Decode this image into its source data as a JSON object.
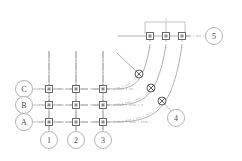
{
  "drawing": {
    "title": "Structural Grid Plan",
    "canvas": {
      "width": 242,
      "height": 161,
      "background": "#ffffff"
    },
    "colors": {
      "grid_line": "#9a9a9a",
      "center_line": "#a8a8a8",
      "node_stroke": "#5a5a5a",
      "node_fill": "#c8c8c8",
      "bubble_stroke": "#a0a0a0",
      "text": "#4a4a4a",
      "dimension": "#9a9a9a"
    },
    "row_grids": [
      {
        "label": "C",
        "bubble_cx": 24,
        "bubble_cy": 89,
        "y": 89,
        "x_start": 33,
        "x_end": 133
      },
      {
        "label": "B",
        "bubble_cx": 24,
        "bubble_cy": 105,
        "y": 105,
        "x_start": 33,
        "x_end": 143
      },
      {
        "label": "A",
        "bubble_cx": 24,
        "bubble_cy": 122,
        "y": 122,
        "x_start": 33,
        "x_end": 152
      }
    ],
    "column_grids": [
      {
        "label": "1",
        "bubble_cx": 49,
        "bubble_cy": 140,
        "x": 49,
        "y_start": 51,
        "y_end": 131
      },
      {
        "label": "2",
        "bubble_cx": 76,
        "bubble_cy": 140,
        "x": 76,
        "y_start": 51,
        "y_end": 131
      },
      {
        "label": "3",
        "bubble_cx": 103,
        "bubble_cy": 140,
        "x": 103,
        "y_start": 51,
        "y_end": 131
      }
    ],
    "radial_grids": [
      {
        "label": "5",
        "bubble_cx": 214,
        "bubble_cy": 36,
        "y": 36,
        "x_start": 118,
        "x_end": 205
      },
      {
        "label": "4",
        "bubble_cx": 176,
        "bubble_cy": 118,
        "x": 176,
        "y": 118
      }
    ],
    "square_nodes": [
      {
        "name": "node-C1",
        "x": 49,
        "y": 89
      },
      {
        "name": "node-C2",
        "x": 76,
        "y": 89
      },
      {
        "name": "node-C3",
        "x": 103,
        "y": 89
      },
      {
        "name": "node-B1",
        "x": 49,
        "y": 105
      },
      {
        "name": "node-B2",
        "x": 76,
        "y": 105
      },
      {
        "name": "node-B3",
        "x": 103,
        "y": 105
      },
      {
        "name": "node-A1",
        "x": 49,
        "y": 122
      },
      {
        "name": "node-A2",
        "x": 76,
        "y": 122
      },
      {
        "name": "node-A3",
        "x": 103,
        "y": 122
      },
      {
        "name": "node-top-left",
        "x": 150,
        "y": 36
      },
      {
        "name": "node-top-mid",
        "x": 166,
        "y": 36
      },
      {
        "name": "node-top-right",
        "x": 182,
        "y": 36
      }
    ],
    "cross_nodes": [
      {
        "name": "node-arc-upper",
        "x": 139,
        "y": 74
      },
      {
        "name": "node-arc-middle",
        "x": 151,
        "y": 88
      },
      {
        "name": "node-arc-lower",
        "x": 162,
        "y": 101
      }
    ],
    "arcs": [
      {
        "name": "arc-inner",
        "d": "M 115 89 Q 141 89 150 45"
      },
      {
        "name": "arc-middle",
        "d": "M 120 105 Q 155 105 166 45"
      },
      {
        "name": "arc-outer",
        "d": "M 128 122 Q 170 122 182 45"
      }
    ],
    "leader_line": {
      "name": "leader-diagonal",
      "x1": 118,
      "y1": 54,
      "x2": 139,
      "y2": 74
    },
    "dimension": {
      "label": "1",
      "y_bar": 22,
      "x_left": 145,
      "x_right": 185,
      "tick_positions": [
        145,
        166,
        185
      ],
      "text_x": 166,
      "text_y": 20
    },
    "top_rail": {
      "y": 36,
      "x_start": 118,
      "x_end": 205
    }
  }
}
